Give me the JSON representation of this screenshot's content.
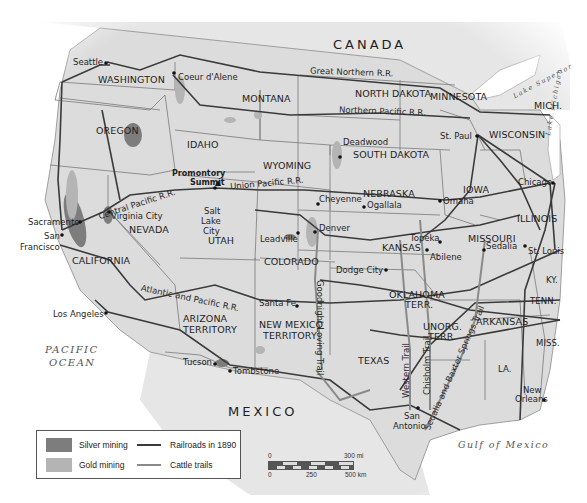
{
  "map": {
    "colors": {
      "land_us": "#dcdcdc",
      "land_other": "#e6e6e6",
      "water": "#ffffff",
      "borders": "#7a7a7a",
      "railroad": "#3a3a3a",
      "cattle_trail": "#8a8a8a",
      "silver_mining": "#7d7d7d",
      "gold_mining": "#b4b4b4",
      "text": "#1e1e1e"
    },
    "countries": {
      "canada": "CANADA",
      "mexico": "MEXICO"
    },
    "water_bodies": {
      "pacific_line1": "PACIFIC",
      "pacific_line2": "OCEAN",
      "gulf": "Gulf of Mexico",
      "lake_superior": "Lake Superior",
      "lake_michigan": "Lake Michigan"
    },
    "states": {
      "washington": "WASHINGTON",
      "oregon": "OREGON",
      "idaho": "IDAHO",
      "montana": "MONTANA",
      "wyoming": "WYOMING",
      "north_dakota": "NORTH DAKOTA",
      "south_dakota": "SOUTH DAKOTA",
      "minnesota": "MINNESOTA",
      "wisconsin": "WISCONSIN",
      "michigan": "MICH.",
      "iowa": "IOWA",
      "illinois": "ILLINOIS",
      "nebraska": "NEBRASKA",
      "nevada": "NEVADA",
      "california": "CALIFORNIA",
      "utah": "UTAH",
      "colorado": "COLORADO",
      "kansas": "KANSAS",
      "missouri": "MISSOURI",
      "kentucky": "KY.",
      "tennessee": "TENN.",
      "arkansas": "ARKANSAS",
      "mississippi": "MISS.",
      "louisiana": "LA.",
      "texas": "TEXAS",
      "arizona_line1": "ARIZONA",
      "arizona_line2": "TERRITORY",
      "new_mexico_line1": "NEW MEXICO",
      "new_mexico_line2": "TERRITORY",
      "oklahoma_line1": "OKLAHOMA",
      "oklahoma_line2": "TERR.",
      "unorg_line1": "UNORG.",
      "unorg_line2": "TERR."
    },
    "cities": {
      "seattle": "Seattle",
      "coeur_dalene": "Coeur d'Alene",
      "sacramento": "Sacramento",
      "san_francisco_line1": "San",
      "san_francisco_line2": "Francisco",
      "virginia_city": "Virginia City",
      "promontory_line1": "Promontory",
      "promontory_line2": "Summit",
      "salt_lake_line1": "Salt",
      "salt_lake_line2": "Lake",
      "salt_lake_line3": "City",
      "deadwood": "Deadwood",
      "st_paul": "St. Paul",
      "chicago": "Chicago",
      "omaha": "Omaha",
      "cheyenne": "Cheyenne",
      "ogallala": "Ogallala",
      "denver": "Denver",
      "leadville": "Leadville",
      "topeka": "Topeka",
      "abilene": "Abilene",
      "sedalia": "Sedalia",
      "st_louis": "St. Louis",
      "dodge_city": "Dodge City",
      "santa_fe": "Santa Fe",
      "los_angeles": "Los Angeles",
      "tucson": "Tucson",
      "tombstone": "Tombstone",
      "san_antonio_line1": "San",
      "san_antonio_line2": "Antonio",
      "new_orleans_line1": "New",
      "new_orleans_line2": "Orleans"
    },
    "railroads": {
      "great_northern": "Great Northern R.R.",
      "northern_pacific": "Northern Pacific R.R.",
      "central_pacific": "Central Pacific R.R.",
      "union_pacific": "Union Pacific R.R.",
      "atlantic_pacific": "Atlantic and Pacific R.R."
    },
    "trails": {
      "goodnight_loving": "Goodnight-Loving Trail",
      "western": "Western Trail",
      "chisholm": "Chisholm Trail",
      "sedalia_baxter": "Sedalia and Baxter Springs Trail"
    }
  },
  "legend": {
    "items": [
      {
        "label": "Silver mining",
        "type": "swatch",
        "color": "#7d7d7d"
      },
      {
        "label": "Gold mining",
        "type": "swatch",
        "color": "#b4b4b4"
      },
      {
        "label": "Railroads in 1890",
        "type": "line",
        "color": "#3a3a3a"
      },
      {
        "label": "Cattle trails",
        "type": "line",
        "color": "#8a8a8a"
      }
    ]
  },
  "scale": {
    "mi_start": "0",
    "mi_end": "300 mi",
    "km_start": "0",
    "km_mid": "250",
    "km_end": "500 km"
  }
}
